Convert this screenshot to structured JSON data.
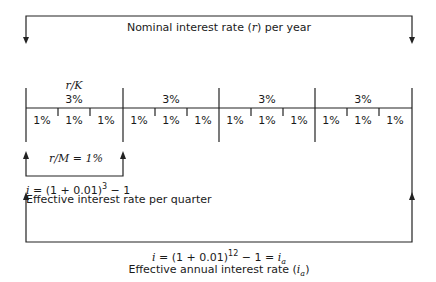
{
  "diagram": {
    "top_bracket_label": "Nominal interest rate (r) per year",
    "top_bracket_label_parts": {
      "pre": "Nominal interest rate (",
      "var": "r",
      "post": ") per year"
    },
    "period_label_top": "r/K",
    "quarters": [
      {
        "label": "3%",
        "months": [
          "1%",
          "1%",
          "1%"
        ]
      },
      {
        "label": "3%",
        "months": [
          "1%",
          "1%",
          "1%"
        ]
      },
      {
        "label": "3%",
        "months": [
          "1%",
          "1%",
          "1%"
        ]
      },
      {
        "label": "3%",
        "months": [
          "1%",
          "1%",
          "1%"
        ]
      }
    ],
    "monthly_rate_label": "r/M = 1%",
    "quarter_formula": "i = (1 + 0.01)^3 − 1",
    "quarter_formula_parts": {
      "var": "i",
      "body": " = (1 + 0.01)",
      "exp": "3",
      "tail": " − 1"
    },
    "quarter_caption": "Effective interest rate per quarter",
    "annual_formula": "i = (1 + 0.01)^12 − 1 = i_a",
    "annual_formula_parts": {
      "var": "i",
      "body": " = (1 + 0.01)",
      "exp": "12",
      "tail": " − 1 = ",
      "result": "i",
      "result_sub": "a"
    },
    "annual_caption": "Effective annual interest rate (i_a)",
    "annual_caption_parts": {
      "pre": "Effective annual interest rate (",
      "var": "i",
      "sub": "a",
      "post": ")"
    }
  }
}
